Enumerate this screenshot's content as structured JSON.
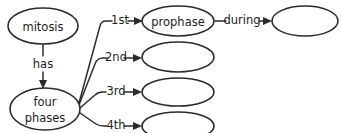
{
  "diagram": {
    "type": "concept-map",
    "background_color": "#ffffff",
    "stroke_color": "#2b2b2b",
    "text_color": "#1c1c1c",
    "nodes": [
      {
        "id": "mitosis",
        "label": "mitosis",
        "shape": "ellipse",
        "cx": 43,
        "cy": 26,
        "rx": 35,
        "ry": 18,
        "empty": false
      },
      {
        "id": "fourphases",
        "label": "four phases",
        "label_line1": "four",
        "label_line2": "phases",
        "shape": "ellipse",
        "cx": 45,
        "cy": 109,
        "rx": 35,
        "ry": 21,
        "empty": false
      },
      {
        "id": "prophase",
        "label": "prophase",
        "shape": "ellipse",
        "cx": 178,
        "cy": 21,
        "rx": 36,
        "ry": 15,
        "empty": false
      },
      {
        "id": "blank_top",
        "label": "",
        "shape": "ellipse",
        "cx": 305,
        "cy": 21,
        "rx": 33,
        "ry": 15,
        "empty": true
      },
      {
        "id": "blank_2",
        "label": "",
        "shape": "ellipse",
        "cx": 178,
        "cy": 57,
        "rx": 36,
        "ry": 15,
        "empty": true
      },
      {
        "id": "blank_3",
        "label": "",
        "shape": "ellipse",
        "cx": 178,
        "cy": 92,
        "rx": 36,
        "ry": 14,
        "empty": true
      },
      {
        "id": "blank_4",
        "label": "",
        "shape": "ellipse",
        "cx": 178,
        "cy": 126,
        "rx": 36,
        "ry": 14,
        "empty": true
      }
    ],
    "edges": [
      {
        "id": "has",
        "label": "has",
        "from": "mitosis",
        "to": "fourphases",
        "direction": "down"
      },
      {
        "id": "e1st",
        "label": "1st",
        "from": "fourphases",
        "to": "prophase",
        "direction": "right"
      },
      {
        "id": "e2nd",
        "label": "2nd",
        "from": "fourphases",
        "to": "blank_2",
        "direction": "right"
      },
      {
        "id": "e3rd",
        "label": "3rd",
        "from": "fourphases",
        "to": "blank_3",
        "direction": "right"
      },
      {
        "id": "e4th",
        "label": "4th",
        "from": "fourphases",
        "to": "blank_4",
        "direction": "right"
      },
      {
        "id": "during",
        "label": "during",
        "from": "prophase",
        "to": "blank_top",
        "direction": "right"
      }
    ]
  }
}
